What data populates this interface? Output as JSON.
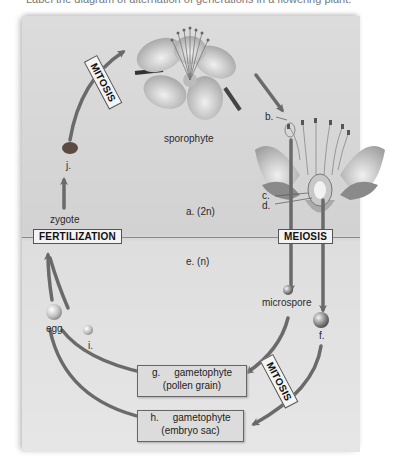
{
  "caption": "Label the diagram of alternation of generations in a flowering plant.",
  "diagram": {
    "title": "Alternation of generations in a flowering plant",
    "process_labels": {
      "mitosis_top": "MITOSIS",
      "mitosis_bottom": "MITOSIS",
      "meiosis": "MEIOSIS",
      "fertilization": "FERTILIZATION"
    },
    "structure_labels": {
      "sporophyte": "sporophyte",
      "zygote": "zygote",
      "microspore": "microspore",
      "egg": "egg"
    },
    "letter_labels": {
      "a": "a. (2n)",
      "b": "b.",
      "c": "c.",
      "d": "d.",
      "e": "e.  (n)",
      "f": "f.",
      "i": "i.",
      "j": "j."
    },
    "gametophyte_boxes": [
      {
        "letter": "g.",
        "title": "gametophyte",
        "subtitle": "(pollen grain)"
      },
      {
        "letter": "h.",
        "title": "gametophyte",
        "subtitle": "(embryo sac)"
      }
    ],
    "colors": {
      "panel": "#d6d6d6",
      "arrow": "#6a6a6a",
      "divider": "#8a8a8a",
      "label_box": "#f4f4f4",
      "gametophyte_box": "#dcdcdc"
    }
  }
}
